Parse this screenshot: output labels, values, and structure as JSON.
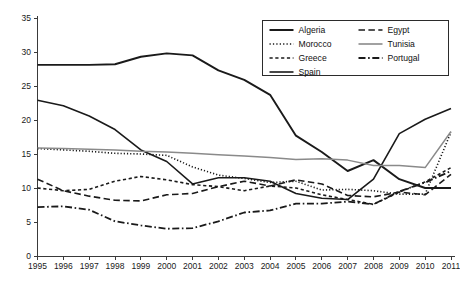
{
  "chart_data": {
    "type": "line",
    "title": "",
    "subtitle": "",
    "xlabel": "",
    "ylabel": "",
    "grid": false,
    "legend_position": "top-right",
    "xlim": [
      1995,
      2011
    ],
    "ylim": [
      0,
      35
    ],
    "yticks": [
      0,
      5,
      10,
      15,
      20,
      25,
      30,
      35
    ],
    "categories": [
      "1995",
      "1996",
      "1997",
      "1998",
      "1999",
      "2000",
      "2001",
      "2002",
      "2003",
      "2004",
      "2005",
      "2006",
      "2007",
      "2008",
      "2009",
      "2010",
      "2011"
    ],
    "series": [
      {
        "name": "Algeria",
        "style": "solid",
        "color": "#1a1a1a",
        "width": 1.9,
        "values": [
          28.1,
          28.1,
          28.1,
          28.2,
          29.3,
          29.8,
          29.5,
          27.3,
          25.9,
          23.7,
          17.7,
          15.3,
          12.5,
          14.1,
          11.3,
          10.0,
          10.0
        ]
      },
      {
        "name": "Morocco",
        "style": "dotted",
        "color": "#1a1a1a",
        "width": 1.6,
        "values": [
          15.8,
          15.6,
          15.4,
          15.1,
          15.0,
          14.8,
          13.1,
          11.9,
          11.4,
          10.8,
          11.0,
          9.7,
          9.8,
          9.6,
          9.1,
          9.1,
          18.2
        ]
      },
      {
        "name": "Greece",
        "style": "short-dash",
        "color": "#1a1a1a",
        "width": 1.6,
        "values": [
          10.0,
          9.6,
          9.8,
          11.0,
          11.7,
          11.2,
          10.5,
          10.2,
          9.6,
          10.3,
          10.0,
          9.0,
          8.3,
          7.6,
          9.4,
          10.9,
          13.0
        ]
      },
      {
        "name": "Spain",
        "style": "solid",
        "color": "#1a1a1a",
        "width": 1.6,
        "values": [
          22.9,
          22.1,
          20.6,
          18.6,
          15.6,
          13.9,
          10.6,
          11.5,
          11.5,
          11.0,
          9.2,
          8.5,
          8.3,
          11.3,
          18.0,
          20.1,
          21.7
        ]
      },
      {
        "name": "Egypt",
        "style": "long-dash",
        "color": "#1a1a1a",
        "width": 1.6,
        "values": [
          11.3,
          9.6,
          8.8,
          8.2,
          8.1,
          9.0,
          9.2,
          10.2,
          11.0,
          10.3,
          11.2,
          10.6,
          8.9,
          8.7,
          9.4,
          9.0,
          12.0
        ]
      },
      {
        "name": "Tunisia",
        "style": "solid",
        "color": "#8a8a8a",
        "width": 1.5,
        "values": [
          15.9,
          15.8,
          15.7,
          15.6,
          15.4,
          15.3,
          15.1,
          14.9,
          14.7,
          14.5,
          14.2,
          14.3,
          14.1,
          13.3,
          13.3,
          13.0,
          18.3
        ]
      },
      {
        "name": "Portugal",
        "style": "dash-dot",
        "color": "#1a1a1a",
        "width": 1.8,
        "values": [
          7.2,
          7.3,
          6.8,
          5.1,
          4.5,
          4.0,
          4.1,
          5.1,
          6.4,
          6.7,
          7.7,
          7.7,
          8.0,
          7.6,
          9.5,
          10.8,
          12.5
        ]
      }
    ],
    "legend_entries": [
      {
        "label": "Algeria",
        "style": "solid",
        "color": "#1a1a1a",
        "width": 2.0
      },
      {
        "label": "Egypt",
        "style": "long-dash",
        "color": "#1a1a1a",
        "width": 1.6
      },
      {
        "label": "Morocco",
        "style": "dotted",
        "color": "#1a1a1a",
        "width": 1.7
      },
      {
        "label": "Tunisia",
        "style": "solid",
        "color": "#8a8a8a",
        "width": 1.6
      },
      {
        "label": "Greece",
        "style": "short-dash",
        "color": "#1a1a1a",
        "width": 1.7
      },
      {
        "label": "Portugal",
        "style": "dash-dot",
        "color": "#1a1a1a",
        "width": 1.8
      },
      {
        "label": "Spain",
        "style": "solid",
        "color": "#1a1a1a",
        "width": 1.6
      }
    ]
  }
}
